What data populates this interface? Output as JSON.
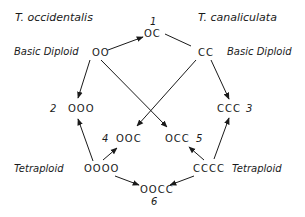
{
  "species": {
    "left": "T. occidentalis",
    "right": "T. canaliculata"
  },
  "labels": {
    "basic_diploid_left": "Basic Diploid",
    "basic_diploid_right": "Basic Diploid",
    "tetraploid_left": "Tetraploid",
    "tetraploid_right": "Tetraploid"
  },
  "nodes": {
    "oo": "OO",
    "cc": "CC",
    "oc": "OC",
    "ooo": "OOO",
    "ccc": "CCC",
    "ooc": "OOC",
    "occ": "OCC",
    "oooo": "OOOO",
    "cccc": "CCCC",
    "oocc": "OOCC"
  },
  "numbers": {
    "n1": "1",
    "n2": "2",
    "n3": "3",
    "n4": "4",
    "n5": "5",
    "n6": "6"
  },
  "edges": [
    {
      "from": "OO",
      "to": "OC",
      "arrow": true
    },
    {
      "from": "CC",
      "to": "OC",
      "arrow": false
    },
    {
      "from": "OO",
      "to": "OOO",
      "arrow": true
    },
    {
      "from": "OO",
      "to": "OCC",
      "arrow": true
    },
    {
      "from": "CC",
      "to": "CCC",
      "arrow": true
    },
    {
      "from": "CC",
      "to": "OOC",
      "arrow": true
    },
    {
      "from": "OOOO",
      "to": "OOO",
      "arrow": true
    },
    {
      "from": "OOOO",
      "to": "OOC",
      "arrow": true
    },
    {
      "from": "OOOO",
      "to": "OOCC",
      "arrow": true
    },
    {
      "from": "CCCC",
      "to": "CCC",
      "arrow": true
    },
    {
      "from": "CCCC",
      "to": "OCC",
      "arrow": true
    },
    {
      "from": "CCCC",
      "to": "OOCC",
      "arrow": true
    }
  ],
  "colors": {
    "ink": "#1a1a1a",
    "background": "#ffffff"
  }
}
